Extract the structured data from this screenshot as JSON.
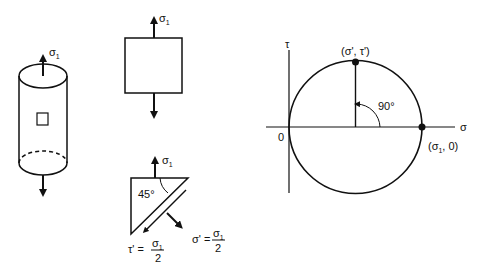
{
  "cylinder": {
    "stress_label": "σ",
    "stress_subscript": "1"
  },
  "square_element": {
    "stress_label": "σ",
    "stress_subscript": "1"
  },
  "wedge_element": {
    "stress_label": "σ",
    "stress_subscript": "1",
    "angle_label": "45°",
    "shear_eq": {
      "lhs": "τ' =",
      "num": "σ",
      "num_sub": "1",
      "den": "2"
    },
    "normal_eq": {
      "lhs": "σ' =",
      "num": "σ",
      "num_sub": "1",
      "den": "2"
    }
  },
  "mohr_circle": {
    "tau_axis_label": "τ",
    "sigma_axis_label": "σ",
    "origin_label": "0",
    "top_point_label": "(σ', τ')",
    "right_point_label": "(σ",
    "right_point_sub": "1",
    "right_point_tail": ", 0)",
    "angle_label": "90°"
  }
}
